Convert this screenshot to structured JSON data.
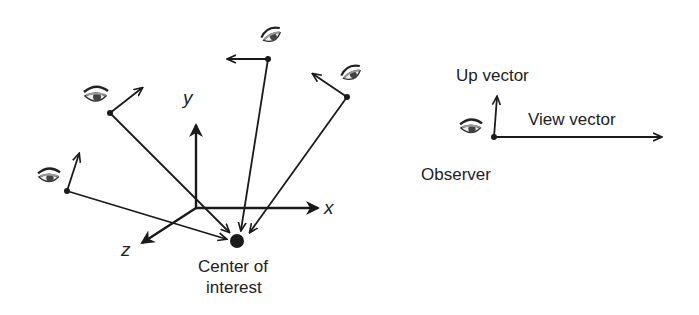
{
  "axes": {
    "x": "x",
    "y": "y",
    "z": "z"
  },
  "center_label_line1": "Center of",
  "center_label_line2": "interest",
  "legend": {
    "up_vector": "Up vector",
    "view_vector": "View vector",
    "observer": "Observer"
  },
  "colors": {
    "stroke": "#1a1a1a",
    "text": "#222222"
  }
}
